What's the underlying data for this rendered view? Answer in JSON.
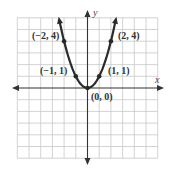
{
  "chart_data": {
    "type": "line",
    "title": "",
    "function": "y = x^2",
    "xlabel": "x",
    "ylabel": "y",
    "xlim": [
      -6,
      6
    ],
    "ylim": [
      -6,
      6
    ],
    "grid": true,
    "legend": null,
    "series": [
      {
        "name": "y = x^2",
        "x": [
          -2.4,
          -2,
          -1,
          0,
          1,
          2,
          2.4
        ],
        "y": [
          5.76,
          4,
          1,
          0,
          1,
          4,
          5.76
        ]
      }
    ],
    "points": [
      {
        "x": -2,
        "y": 4,
        "label": "(−2, 4)"
      },
      {
        "x": -1,
        "y": 1,
        "label": "(−1, 1)"
      },
      {
        "x": 0,
        "y": 0,
        "label": "(0, 0)"
      },
      {
        "x": 1,
        "y": 1,
        "label": "(1, 1)"
      },
      {
        "x": 2,
        "y": 4,
        "label": "(2, 4)"
      }
    ],
    "annotations": [
      "(−2, 4)",
      "(−1, 1)",
      "(0, 0)",
      "(1, 1)",
      "(2, 4)"
    ]
  },
  "labels": {
    "x_axis": "x",
    "y_axis": "y",
    "p_m2": "(−2, 4)",
    "p_m1": "(−1, 1)",
    "p_0": "(0, 0)",
    "p_1": "(1, 1)",
    "p_2": "(2, 4)"
  },
  "colors": {
    "curve": "#2a2a2a",
    "grid": "#c8c8c8",
    "axis": "#333333"
  }
}
